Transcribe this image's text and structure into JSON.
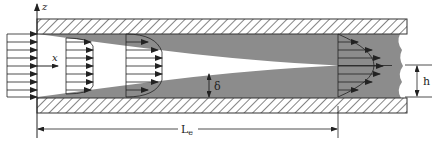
{
  "diagram": {
    "axes": {
      "x_label": "x",
      "z_label": "z"
    },
    "labels": {
      "boundary_layer": "δ",
      "half_height": "h",
      "entrance_length": "L",
      "entrance_length_sub": "e"
    },
    "colors": {
      "boundary_layer_fill": "#8c8c8c",
      "core_fill": "#ffffff",
      "line": "#222222",
      "wall_hatch": "#333333"
    },
    "profiles": [
      {
        "name": "inlet-uniform",
        "x": 7,
        "head_x": 37
      },
      {
        "name": "developing-1",
        "x": 66,
        "head_x": 93
      },
      {
        "name": "developing-2",
        "x": 126,
        "head_x": 162
      },
      {
        "name": "fully-developed",
        "x": 338,
        "head_x": 383
      }
    ]
  }
}
